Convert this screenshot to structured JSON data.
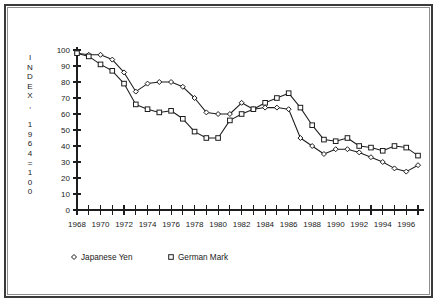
{
  "chart_data": {
    "type": "line",
    "title": "",
    "xlabel": "",
    "ylabel": "INDEX, 1964=100",
    "ylabel_chars": [
      "I",
      "N",
      "D",
      "E",
      "X",
      ",",
      "",
      "1",
      "9",
      "6",
      "4",
      "=",
      "1",
      "0",
      "0"
    ],
    "xlim": [
      1968,
      1997
    ],
    "ylim": [
      0,
      100
    ],
    "grid": false,
    "legend_position": "bottom-left",
    "yticks": [
      0,
      10,
      20,
      30,
      40,
      50,
      60,
      70,
      80,
      90,
      100
    ],
    "ytick_labels": [
      "0",
      "10",
      "20",
      "30",
      "40",
      "50",
      "60",
      "70",
      "80",
      "90",
      "100"
    ],
    "xticks": [
      1968,
      1969,
      1970,
      1971,
      1972,
      1973,
      1974,
      1975,
      1976,
      1977,
      1978,
      1979,
      1980,
      1981,
      1982,
      1983,
      1984,
      1985,
      1986,
      1987,
      1988,
      1989,
      1990,
      1991,
      1992,
      1993,
      1994,
      1995,
      1996,
      1997
    ],
    "xtick_labels_shown": [
      "1968",
      "1970",
      "1972",
      "1974",
      "1976",
      "1978",
      "1980",
      "1982",
      "1984",
      "1986",
      "1988",
      "1990",
      "1992",
      "1994",
      "1996"
    ],
    "x": [
      1968,
      1969,
      1970,
      1971,
      1972,
      1973,
      1974,
      1975,
      1976,
      1977,
      1978,
      1979,
      1980,
      1981,
      1982,
      1983,
      1984,
      1985,
      1986,
      1987,
      1988,
      1989,
      1990,
      1991,
      1992,
      1993,
      1994,
      1995,
      1996,
      1997
    ],
    "series": [
      {
        "name": "Japanese Yen",
        "marker": "diamond",
        "values": [
          98,
          97,
          97,
          94,
          86,
          74,
          79,
          80,
          80,
          77,
          70,
          61,
          60,
          60,
          67,
          63,
          64,
          64,
          63,
          45,
          40,
          35,
          38,
          38,
          36,
          33,
          30,
          26,
          24,
          28
        ]
      },
      {
        "name": "German Mark",
        "marker": "square",
        "values": [
          98,
          96,
          91,
          87,
          79,
          66,
          63,
          61,
          62,
          57,
          49,
          45,
          45,
          56,
          60,
          63,
          67,
          70,
          73,
          64,
          53,
          44,
          43,
          45,
          40,
          39,
          37,
          40,
          39,
          34
        ]
      }
    ]
  },
  "legend": {
    "entries": [
      {
        "label": "Japanese Yen",
        "marker": "diamond"
      },
      {
        "label": "German Mark",
        "marker": "square"
      }
    ]
  }
}
